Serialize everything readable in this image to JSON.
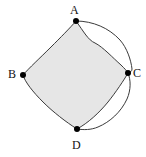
{
  "figure": {
    "kind": "geometry-diagram",
    "background_color": "#ffffff",
    "stroke_color": "#3a3a3a",
    "fill_color": "#e6e6e6",
    "point_color": "#000000",
    "vertices": [
      {
        "id": "A",
        "label": "A",
        "x": 76,
        "y": 21,
        "label_x": 70,
        "label_y": 4
      },
      {
        "id": "B",
        "label": "B",
        "x": 23,
        "y": 75,
        "label_x": 8,
        "label_y": 68
      },
      {
        "id": "C",
        "label": "C",
        "x": 128,
        "y": 73,
        "label_x": 133,
        "label_y": 67
      },
      {
        "id": "D",
        "label": "D",
        "x": 77,
        "y": 129,
        "label_x": 72,
        "label_y": 139
      }
    ],
    "circle": {
      "center_x": 77,
      "center_y": 74,
      "radius_x": 57,
      "radius_y": 55
    }
  },
  "chart_data": {
    "type": "scatter",
    "title": "",
    "xlabel": "",
    "ylabel": "",
    "points": [
      {
        "label": "A",
        "x": 76,
        "y": 21
      },
      {
        "label": "B",
        "x": 23,
        "y": 75
      },
      {
        "label": "C",
        "x": 128,
        "y": 73
      },
      {
        "label": "D",
        "x": 77,
        "y": 129
      }
    ],
    "shapes": [
      {
        "name": "circumscribed-circle",
        "type": "ellipse",
        "cx": 77,
        "cy": 74,
        "rx": 57,
        "ry": 55,
        "filled": false
      },
      {
        "name": "shaded-region",
        "type": "closed-curve",
        "through": [
          "A",
          "B",
          "D",
          "C"
        ],
        "filled": true,
        "fill": "#e6e6e6"
      }
    ]
  }
}
